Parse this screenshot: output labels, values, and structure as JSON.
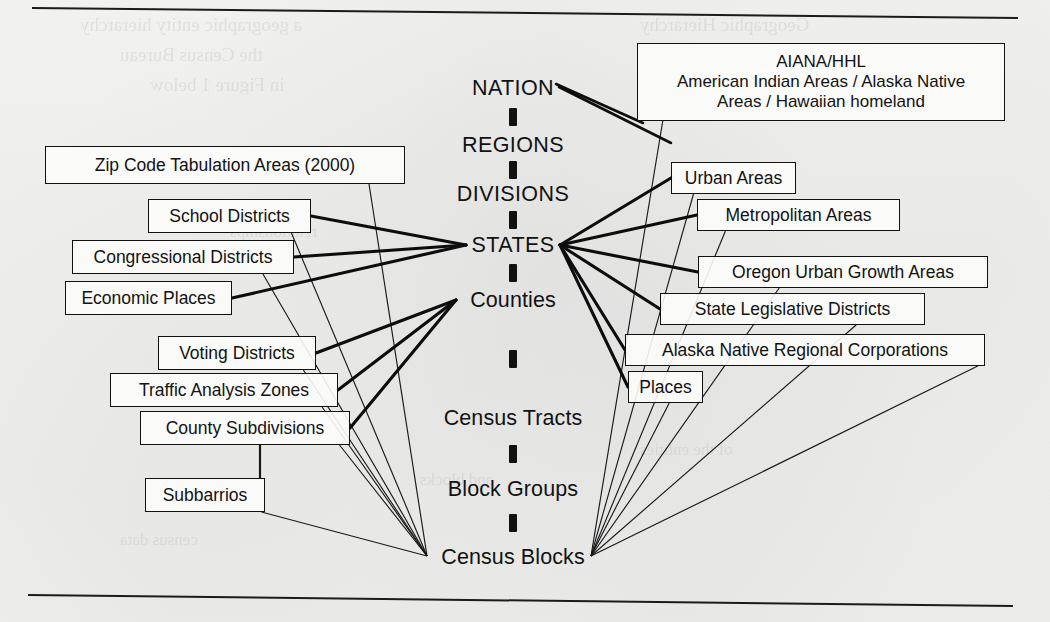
{
  "figure": {
    "background_color": "#f3f3f2",
    "ink_color": "#111111"
  },
  "spine": {
    "name": "central-census-hierarchy",
    "levels": [
      {
        "id": "nation",
        "label": "NATION",
        "style": "caps",
        "x": 513,
        "y": 88
      },
      {
        "id": "regions",
        "label": "REGIONS",
        "style": "caps",
        "x": 513,
        "y": 145
      },
      {
        "id": "divisions",
        "label": "DIVISIONS",
        "style": "caps",
        "x": 513,
        "y": 194
      },
      {
        "id": "states",
        "label": "STATES",
        "style": "caps",
        "x": 513,
        "y": 245
      },
      {
        "id": "counties",
        "label": "Counties",
        "style": "mixed",
        "x": 513,
        "y": 300
      },
      {
        "id": "census_tracts",
        "label": "Census Tracts",
        "style": "mixed",
        "x": 513,
        "y": 418
      },
      {
        "id": "block_groups",
        "label": "Block Groups",
        "style": "mixed",
        "x": 513,
        "y": 489
      },
      {
        "id": "census_blocks",
        "label": "Census Blocks",
        "style": "mixed",
        "x": 513,
        "y": 557
      }
    ],
    "connector_style": "thick vertical dashed bar"
  },
  "left_boxes": [
    {
      "id": "zip_code_tabulation_areas",
      "label": "Zip Code Tabulation Areas (2000)",
      "x": 45,
      "y": 146,
      "w": 360,
      "h": 38
    },
    {
      "id": "school_districts",
      "label": "School Districts",
      "x": 148,
      "y": 199,
      "w": 163,
      "h": 34
    },
    {
      "id": "congressional_districts",
      "label": "Congressional Districts",
      "x": 72,
      "y": 240,
      "w": 222,
      "h": 34
    },
    {
      "id": "economic_places",
      "label": "Economic Places",
      "x": 65,
      "y": 281,
      "w": 167,
      "h": 34
    },
    {
      "id": "voting_districts",
      "label": "Voting Districts",
      "x": 158,
      "y": 336,
      "w": 158,
      "h": 34
    },
    {
      "id": "traffic_analysis_zones",
      "label": "Traffic Analysis Zones",
      "x": 110,
      "y": 373,
      "w": 228,
      "h": 34
    },
    {
      "id": "county_subdivisions",
      "label": "County Subdivisions",
      "x": 140,
      "y": 411,
      "w": 210,
      "h": 34
    },
    {
      "id": "subbarrios",
      "label": "Subbarrios",
      "x": 145,
      "y": 478,
      "w": 120,
      "h": 34
    }
  ],
  "right_boxes": [
    {
      "id": "aiana_hhl",
      "label_lines": [
        "AIANA/HHL",
        "American Indian Areas / Alaska Native",
        "Areas / Hawaiian homeland"
      ],
      "x": 637,
      "y": 43,
      "w": 368,
      "h": 78,
      "multiline": true
    },
    {
      "id": "urban_areas",
      "label": "Urban Areas",
      "x": 671,
      "y": 162,
      "w": 125,
      "h": 32
    },
    {
      "id": "metropolitan_areas",
      "label": "Metropolitan Areas",
      "x": 697,
      "y": 199,
      "w": 203,
      "h": 32
    },
    {
      "id": "oregon_urban_growth_areas",
      "label": "Oregon Urban Growth Areas",
      "x": 698,
      "y": 256,
      "w": 290,
      "h": 32
    },
    {
      "id": "state_legislative_districts",
      "label": "State Legislative Districts",
      "x": 660,
      "y": 293,
      "w": 265,
      "h": 32
    },
    {
      "id": "alaska_native_regional_corporations",
      "label": "Alaska Native Regional Corporations",
      "x": 625,
      "y": 334,
      "w": 360,
      "h": 32
    },
    {
      "id": "places",
      "label": "Places",
      "x": 628,
      "y": 371,
      "w": 75,
      "h": 32
    }
  ],
  "ghost_text": [
    {
      "text": "a geographic entity hierarchy",
      "x": 80,
      "y": 14,
      "size": 19
    },
    {
      "text": "the Census Bureau",
      "x": 120,
      "y": 44,
      "size": 19
    },
    {
      "text": "in Figure 1 below",
      "x": 150,
      "y": 74,
      "size": 19
    },
    {
      "text": "Geographic Hierarchy",
      "x": 640,
      "y": 14,
      "size": 19
    },
    {
      "text": "relationships",
      "x": 230,
      "y": 222,
      "size": 17
    },
    {
      "text": "of the entities",
      "x": 640,
      "y": 440,
      "size": 17
    },
    {
      "text": "census data",
      "x": 120,
      "y": 530,
      "size": 17
    },
    {
      "text": "and blocks",
      "x": 420,
      "y": 470,
      "size": 17
    }
  ],
  "rules": [
    {
      "id": "top-rule",
      "x1": 32,
      "y1": 7,
      "x2": 1018,
      "y2": 17
    },
    {
      "id": "bottom-rule",
      "x1": 28,
      "y1": 594,
      "x2": 1013,
      "y2": 605
    }
  ],
  "edges": {
    "to_states_left": [
      "school_districts",
      "congressional_districts",
      "economic_places"
    ],
    "to_counties_left": [
      "voting_districts",
      "traffic_analysis_zones",
      "county_subdivisions"
    ],
    "to_census_blocks_left": [
      "zip_code_tabulation_areas",
      "school_districts",
      "congressional_districts",
      "voting_districts",
      "traffic_analysis_zones",
      "county_subdivisions",
      "subbarrios"
    ],
    "to_nation_right": [
      "aiana_hhl"
    ],
    "to_states_right": [
      "urban_areas",
      "metropolitan_areas",
      "oregon_urban_growth_areas",
      "state_legislative_districts",
      "alaska_native_regional_corporations",
      "places"
    ],
    "to_census_blocks_right": [
      "aiana_hhl",
      "urban_areas",
      "metropolitan_areas",
      "oregon_urban_growth_areas",
      "state_legislative_districts",
      "alaska_native_regional_corporations",
      "places"
    ],
    "to_county_subdivisions": [
      "subbarrios"
    ]
  }
}
